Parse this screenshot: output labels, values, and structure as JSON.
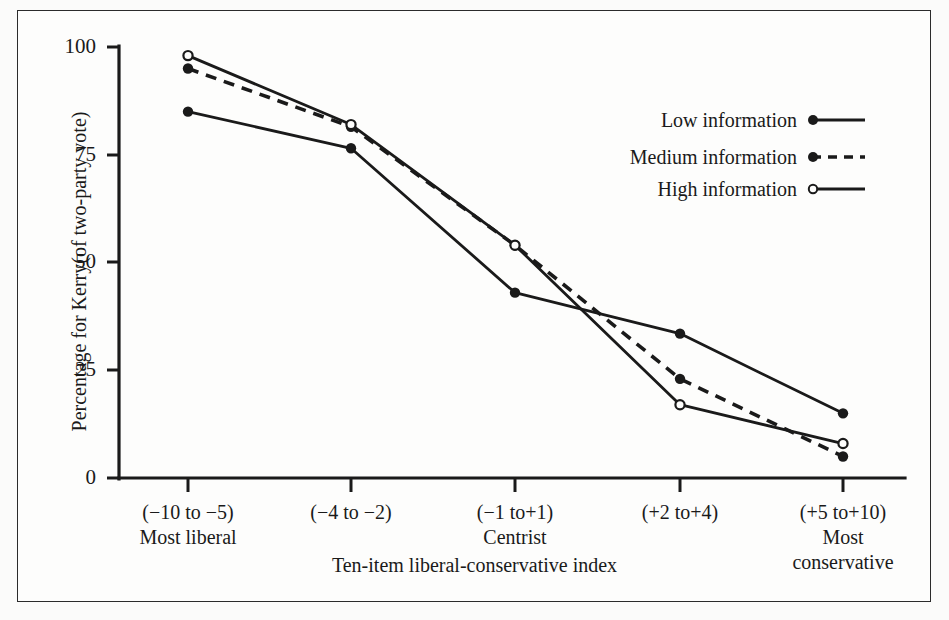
{
  "chart_data": {
    "type": "line",
    "title": "",
    "xlabel": "Ten-item liberal-conservative index",
    "ylabel": "Percentage for Kerry(of two-party vote)",
    "categories": [
      "(−10 to −5)",
      "(−4 to −2)",
      "(−1 to+1)",
      "(+2 to+4)",
      "(+5 to+10)"
    ],
    "category_sublabels": [
      "Most liberal",
      "",
      "Centrist",
      "",
      "Most\nconservative"
    ],
    "ylim": [
      0,
      100
    ],
    "yticks": [
      0,
      25,
      50,
      75,
      100
    ],
    "ytick_labels": [
      "0",
      "25",
      "50",
      "75",
      "100"
    ],
    "grid": false,
    "legend_position": "top-right",
    "series": [
      {
        "name": "Low information",
        "marker": "filled-circle",
        "line_style": "solid",
        "values": [
          85,
          76.5,
          43,
          33.5,
          15
        ]
      },
      {
        "name": "Medium information",
        "marker": "filled-circle",
        "line_style": "dashed",
        "values": [
          95,
          81.5,
          54,
          23,
          5
        ]
      },
      {
        "name": "High information",
        "marker": "open-circle",
        "line_style": "solid",
        "values": [
          98,
          82,
          54,
          17,
          8
        ]
      }
    ]
  },
  "axis": {
    "y_title": "Percentage for Kerry(of two-party vote)",
    "x_title": "Ten-item liberal-conservative index",
    "y_tick_100": "100",
    "y_tick_75": "75",
    "y_tick_50": "50",
    "y_tick_25": "25",
    "y_tick_0": "0"
  },
  "x_categories": [
    {
      "range": "(−10 to −5)",
      "sub1": "Most liberal",
      "sub2": ""
    },
    {
      "range": "(−4 to −2)",
      "sub1": "",
      "sub2": ""
    },
    {
      "range": "(−1 to+1)",
      "sub1": "Centrist",
      "sub2": ""
    },
    {
      "range": "(+2 to+4)",
      "sub1": "",
      "sub2": ""
    },
    {
      "range": "(+5 to+10)",
      "sub1": "Most",
      "sub2": "conservative"
    }
  ],
  "legend": {
    "items": [
      {
        "label": "Low information"
      },
      {
        "label": "Medium information"
      },
      {
        "label": "High information"
      }
    ]
  },
  "colors": {
    "ink": "#1a1a1a",
    "frame": "#2b2b2b",
    "background": "#fdfdfc"
  }
}
